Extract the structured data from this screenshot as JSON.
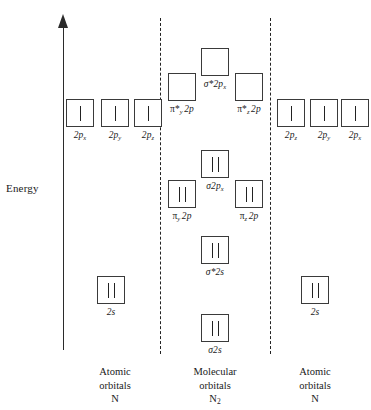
{
  "axis": {
    "label": "Energy",
    "arrow_icon": "up-arrow-icon"
  },
  "columns": [
    {
      "id": "left-atomic",
      "caption_line1": "Atomic",
      "caption_line2": "orbitals",
      "caption_species": "N"
    },
    {
      "id": "molecular",
      "caption_line1": "Molecular",
      "caption_line2": "orbitals",
      "caption_species": "N₂"
    },
    {
      "id": "right-atomic",
      "caption_line1": "Atomic",
      "caption_line2": "orbitals",
      "caption_species": "N"
    }
  ],
  "orbitals": {
    "left_atomic": [
      {
        "name": "left-2px",
        "label": "2p",
        "sub": "x",
        "electrons": 1,
        "x": 80,
        "y": 113
      },
      {
        "name": "left-2py",
        "label": "2p",
        "sub": "y",
        "electrons": 1,
        "x": 115,
        "y": 113
      },
      {
        "name": "left-2pz",
        "label": "2p",
        "sub": "z",
        "electrons": 1,
        "x": 148,
        "y": 113
      },
      {
        "name": "left-2s",
        "label": "2s",
        "sub": "",
        "electrons": 2,
        "x": 111,
        "y": 290
      }
    ],
    "molecular": [
      {
        "name": "sigma-star-2px",
        "label": "σ*2p",
        "sub": "x",
        "electrons": 0,
        "x": 215,
        "y": 62
      },
      {
        "name": "pi-star-y-2p",
        "label": "π*",
        "sub_pre": "y",
        "label2": "2p",
        "electrons": 0,
        "x": 182,
        "y": 87
      },
      {
        "name": "pi-star-z-2p",
        "label": "π*",
        "sub_pre": "z",
        "label2": "2p",
        "electrons": 0,
        "x": 249,
        "y": 87
      },
      {
        "name": "sigma-2px",
        "label": "σ2p",
        "sub": "x",
        "electrons": 2,
        "x": 215,
        "y": 164
      },
      {
        "name": "pi-y-2p",
        "label": "π",
        "sub_pre": "y",
        "label2": "2p",
        "electrons": 2,
        "x": 182,
        "y": 194
      },
      {
        "name": "pi-z-2p",
        "label": "π",
        "sub_pre": "z",
        "label2": "2p",
        "electrons": 2,
        "x": 249,
        "y": 194
      },
      {
        "name": "sigma-star-2s",
        "label": "σ*2s",
        "sub": "",
        "electrons": 2,
        "x": 215,
        "y": 250
      },
      {
        "name": "sigma-2s",
        "label": "σ2s",
        "sub": "",
        "electrons": 2,
        "x": 215,
        "y": 328
      }
    ],
    "right_atomic": [
      {
        "name": "right-2pz",
        "label": "2p",
        "sub": "z",
        "electrons": 1,
        "x": 291,
        "y": 113
      },
      {
        "name": "right-2py",
        "label": "2p",
        "sub": "y",
        "electrons": 1,
        "x": 324,
        "y": 113
      },
      {
        "name": "right-2px",
        "label": "2p",
        "sub": "x",
        "electrons": 1,
        "x": 355,
        "y": 113
      },
      {
        "name": "right-2s",
        "label": "2s",
        "sub": "",
        "electrons": 2,
        "x": 315,
        "y": 290
      }
    ]
  },
  "captions": {
    "left": {
      "x": 115,
      "y": 365
    },
    "center": {
      "x": 215,
      "y": 365
    },
    "right": {
      "x": 315,
      "y": 365
    }
  }
}
